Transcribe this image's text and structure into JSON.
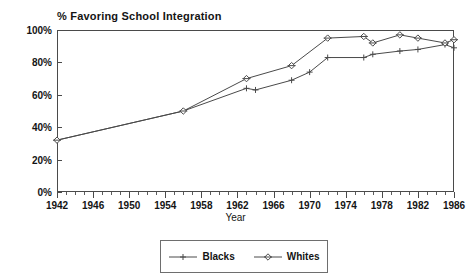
{
  "chart_data": {
    "type": "line",
    "title": "% Favoring School Integration",
    "xlabel": "Year",
    "ylabel": "",
    "xlim": [
      1942,
      1986
    ],
    "ylim": [
      0,
      100
    ],
    "grid": false,
    "legend_position": "bottom-center",
    "y_ticks": [
      "0%",
      "20%",
      "40%",
      "60%",
      "80%",
      "100%"
    ],
    "y_tick_values": [
      0,
      20,
      40,
      60,
      80,
      100
    ],
    "x_ticks": [
      "1942",
      "1946",
      "1950",
      "1954",
      "1958",
      "1962",
      "1966",
      "1970",
      "1974",
      "1978",
      "1982",
      "1986"
    ],
    "x_tick_values": [
      1942,
      1946,
      1950,
      1954,
      1958,
      1962,
      1966,
      1970,
      1974,
      1978,
      1982,
      1986
    ],
    "x_minor_tick_step": 1,
    "series": [
      {
        "name": "Blacks",
        "marker": "plus",
        "color": "#4a4a4a",
        "x": [
          1942,
          1956,
          1963,
          1964,
          1968,
          1970,
          1972,
          1976,
          1977,
          1980,
          1982,
          1985,
          1986
        ],
        "values": [
          32,
          50,
          64,
          63,
          69,
          74,
          83,
          83,
          85,
          87,
          88,
          91,
          89
        ]
      },
      {
        "name": "Whites",
        "marker": "diamond",
        "color": "#4a4a4a",
        "x": [
          1942,
          1956,
          1963,
          1968,
          1972,
          1976,
          1977,
          1980,
          1982,
          1985,
          1986
        ],
        "values": [
          32,
          50,
          70,
          78,
          95,
          96,
          92,
          97,
          95,
          92,
          94
        ]
      }
    ]
  },
  "legend": {
    "entries": [
      {
        "label": "Blacks",
        "marker": "plus"
      },
      {
        "label": "Whites",
        "marker": "diamond"
      }
    ]
  }
}
